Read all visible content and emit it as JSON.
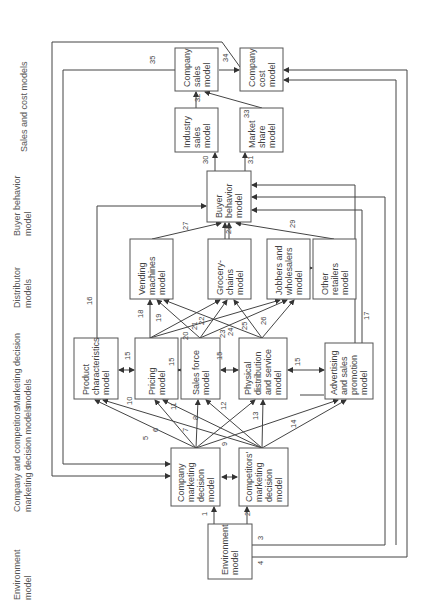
{
  "rows": [
    {
      "id": "environment",
      "lines": [
        "Environment",
        "model"
      ]
    },
    {
      "id": "company-competitors",
      "lines": [
        "Company and competitors'",
        "marketing decision models"
      ]
    },
    {
      "id": "marketing-decision",
      "lines": [
        "Marketing decision",
        "models"
      ]
    },
    {
      "id": "distributor",
      "lines": [
        "Distributor",
        "models"
      ]
    },
    {
      "id": "buyer-behavior",
      "lines": [
        "Buyer behavior",
        "model"
      ]
    },
    {
      "id": "sales-cost",
      "lines": [
        "Sales and cost models"
      ]
    }
  ],
  "boxes": {
    "company_sales": [
      "Company",
      "sales",
      "model"
    ],
    "company_cost": [
      "Company",
      "cost",
      "model"
    ],
    "industry_sales": [
      "Industry",
      "sales",
      "model"
    ],
    "market_share": [
      "Market",
      "share",
      "model"
    ],
    "buyer_behavior": [
      "Buyer",
      "behavior",
      "model"
    ],
    "vending": [
      "Vending",
      "machines",
      "model"
    ],
    "grocery": [
      "Grocery-",
      "chains",
      "model"
    ],
    "jobbers": [
      "Jobbers and",
      "wholesalers",
      "model"
    ],
    "other_retailers": [
      "Other",
      "retailers",
      "model"
    ],
    "product": [
      "Product",
      "characteristics",
      "model"
    ],
    "pricing": [
      "Pricing",
      "model"
    ],
    "sales_force": [
      "Sales force",
      "model"
    ],
    "physical": [
      "Physical",
      "distribution",
      "and service",
      "model"
    ],
    "advertising": [
      "Advertising",
      "and sales",
      "promotion",
      "model"
    ],
    "company_marketing": [
      "Company",
      "marketing",
      "decision",
      "model"
    ],
    "competitors_marketing": [
      "Competitors'",
      "marketing",
      "decision",
      "model"
    ],
    "environment": [
      "Environment",
      "model"
    ]
  },
  "links": [
    "1",
    "2",
    "3",
    "4",
    "5",
    "6",
    "7",
    "8",
    "9",
    "10",
    "11",
    "12",
    "13",
    "14",
    "15",
    "16",
    "17",
    "18",
    "19",
    "20",
    "21",
    "22",
    "23",
    "24",
    "25",
    "26",
    "27",
    "28",
    "29",
    "30",
    "31",
    "32",
    "33",
    "34",
    "35"
  ]
}
